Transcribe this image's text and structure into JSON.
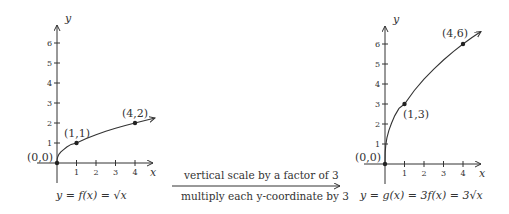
{
  "left_graph": {
    "x_axis_label": "x",
    "y_axis_label": "y",
    "x_ticks": [
      "1",
      "2",
      "3",
      "4"
    ],
    "y_ticks": [
      "1",
      "2",
      "3",
      "4",
      "5",
      "6"
    ],
    "points": [
      {
        "label": "(0,0)",
        "x": 0,
        "y": 0
      },
      {
        "label": "(1,1)",
        "x": 1,
        "y": 1
      },
      {
        "label": "(4,2)",
        "x": 4,
        "y": 2
      }
    ],
    "caption": "y = f(x) = √x"
  },
  "transformation": {
    "top_label": "vertical scale by a factor of 3",
    "bottom_label": "multiply each y-coordinate by 3"
  },
  "right_graph": {
    "x_axis_label": "x",
    "y_axis_label": "y",
    "x_ticks": [
      "1",
      "2",
      "3",
      "4"
    ],
    "y_ticks": [
      "1",
      "2",
      "3",
      "4",
      "5",
      "6"
    ],
    "points": [
      {
        "label": "(0,0)",
        "x": 0,
        "y": 0
      },
      {
        "label": "(1,3)",
        "x": 1,
        "y": 3
      },
      {
        "label": "(4,6)",
        "x": 4,
        "y": 6
      }
    ],
    "caption": "y = g(x) = 3f(x) = 3√x"
  }
}
